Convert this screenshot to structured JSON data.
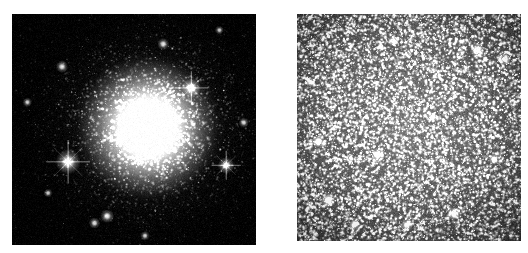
{
  "figure": {
    "title": "Globular cluster comparison",
    "background_color": "#ffffff",
    "width": 528,
    "height": 253
  },
  "panels": [
    {
      "id": "left",
      "name": "wide-field-view",
      "label": "",
      "caption": "",
      "frame": {
        "x": 12,
        "y": 14,
        "width": 244,
        "height": 231
      },
      "background_color": "#000000",
      "star_color": "#ffffff",
      "description": "Ground-based wide-field image of a globular cluster showing an unresolved bright core and a dense halo of resolved stars",
      "core": {
        "center_x_frac": 0.558,
        "center_y_frac": 0.492,
        "core_radius_frac": 0.105,
        "halo_radius_frac": 0.46,
        "peak_brightness": 255
      },
      "star_field": {
        "count": 5200,
        "concentration": "king-profile",
        "min_size_px": 0.6,
        "max_size_px": 2.6,
        "background_level": 4
      },
      "bright_stars": [
        {
          "x_frac": 0.23,
          "y_frac": 0.64,
          "radius_px": 4.2,
          "spikes": true,
          "brightness": 255
        },
        {
          "x_frac": 0.735,
          "y_frac": 0.32,
          "radius_px": 3.2,
          "spikes": true,
          "brightness": 250
        },
        {
          "x_frac": 0.878,
          "y_frac": 0.655,
          "radius_px": 2.8,
          "spikes": true,
          "brightness": 245
        },
        {
          "x_frac": 0.62,
          "y_frac": 0.13,
          "radius_px": 2.0,
          "spikes": false,
          "brightness": 235
        },
        {
          "x_frac": 0.39,
          "y_frac": 0.875,
          "radius_px": 2.3,
          "spikes": false,
          "brightness": 240
        },
        {
          "x_frac": 0.338,
          "y_frac": 0.905,
          "radius_px": 1.9,
          "spikes": false,
          "brightness": 230
        },
        {
          "x_frac": 0.205,
          "y_frac": 0.228,
          "radius_px": 2.1,
          "spikes": false,
          "brightness": 235
        },
        {
          "x_frac": 0.063,
          "y_frac": 0.382,
          "radius_px": 1.6,
          "spikes": false,
          "brightness": 220
        },
        {
          "x_frac": 0.95,
          "y_frac": 0.47,
          "radius_px": 1.7,
          "spikes": false,
          "brightness": 225
        },
        {
          "x_frac": 0.148,
          "y_frac": 0.775,
          "radius_px": 1.5,
          "spikes": false,
          "brightness": 215
        },
        {
          "x_frac": 0.545,
          "y_frac": 0.96,
          "radius_px": 1.6,
          "spikes": false,
          "brightness": 218
        },
        {
          "x_frac": 0.85,
          "y_frac": 0.07,
          "radius_px": 1.5,
          "spikes": false,
          "brightness": 212
        }
      ]
    },
    {
      "id": "right",
      "name": "resolved-core-view",
      "label": "",
      "caption": "",
      "frame": {
        "x": 297,
        "y": 14,
        "width": 224,
        "height": 227
      },
      "background_color": "#0a0a0a",
      "star_color": "#ffffff",
      "description": "High-resolution space-telescope image of the same cluster core, resolving thousands of individual stars across a mottled gray background",
      "core": {
        "center_x_frac": 0.5,
        "center_y_frac": 0.47,
        "core_radius_frac": 0.0,
        "halo_radius_frac": 0.78,
        "peak_brightness": 110
      },
      "star_field": {
        "count": 11000,
        "concentration": "near-uniform",
        "min_size_px": 0.5,
        "max_size_px": 2.4,
        "background_level": 22
      },
      "bright_stars": [
        {
          "x_frac": 0.14,
          "y_frac": 0.82,
          "radius_px": 2.6,
          "spikes": false,
          "brightness": 255
        },
        {
          "x_frac": 0.095,
          "y_frac": 0.56,
          "radius_px": 2.2,
          "spikes": false,
          "brightness": 250
        },
        {
          "x_frac": 0.36,
          "y_frac": 0.62,
          "radius_px": 2.3,
          "spikes": false,
          "brightness": 252
        },
        {
          "x_frac": 0.805,
          "y_frac": 0.158,
          "radius_px": 2.4,
          "spikes": false,
          "brightness": 250
        },
        {
          "x_frac": 0.93,
          "y_frac": 0.2,
          "radius_px": 2.0,
          "spikes": false,
          "brightness": 245
        },
        {
          "x_frac": 0.7,
          "y_frac": 0.88,
          "radius_px": 2.1,
          "spikes": false,
          "brightness": 248
        },
        {
          "x_frac": 0.49,
          "y_frac": 0.93,
          "radius_px": 2.0,
          "spikes": false,
          "brightness": 244
        },
        {
          "x_frac": 0.255,
          "y_frac": 0.93,
          "radius_px": 1.9,
          "spikes": false,
          "brightness": 240
        },
        {
          "x_frac": 0.605,
          "y_frac": 0.455,
          "radius_px": 1.8,
          "spikes": false,
          "brightness": 238
        },
        {
          "x_frac": 0.06,
          "y_frac": 0.3,
          "radius_px": 1.7,
          "spikes": false,
          "brightness": 236
        },
        {
          "x_frac": 0.88,
          "y_frac": 0.64,
          "radius_px": 1.9,
          "spikes": false,
          "brightness": 242
        },
        {
          "x_frac": 0.43,
          "y_frac": 0.12,
          "radius_px": 1.8,
          "spikes": false,
          "brightness": 238
        }
      ]
    }
  ],
  "render": {
    "seed_left": 20240517,
    "seed_right": 77311902
  }
}
